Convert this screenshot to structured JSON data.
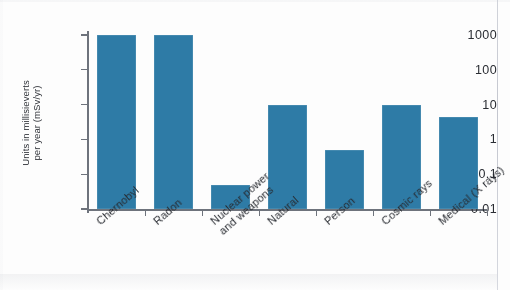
{
  "chart_data": {
    "type": "bar",
    "title": "",
    "subtitle": "",
    "xlabel": "",
    "ylabel": "Units in millisieverts per year (mSv/yr)",
    "yscale": "log",
    "ylim": [
      0.01,
      1000
    ],
    "ytick_labels": [
      "1000",
      "100",
      "10",
      "1",
      "0.1",
      "0.01"
    ],
    "ytick_values": [
      1000,
      100,
      10,
      1,
      0.1,
      0.01
    ],
    "grid": false,
    "legend": null,
    "categories": [
      "Chernobyl",
      "Radon",
      "Nuclear power\nand weapons",
      "Natural",
      "Person",
      "Cosmic rays",
      "Medical (X rays)"
    ],
    "values": [
      1000,
      1000,
      0.05,
      10,
      0.5,
      10,
      4.5
    ],
    "bar_color": "#2e7ba6",
    "axis_color": "#6e737c",
    "text_color": "#26292f"
  },
  "axis": {
    "y_title_line1": "Units in millisieverts",
    "y_title_line2": "per year (mSv/yr)"
  }
}
